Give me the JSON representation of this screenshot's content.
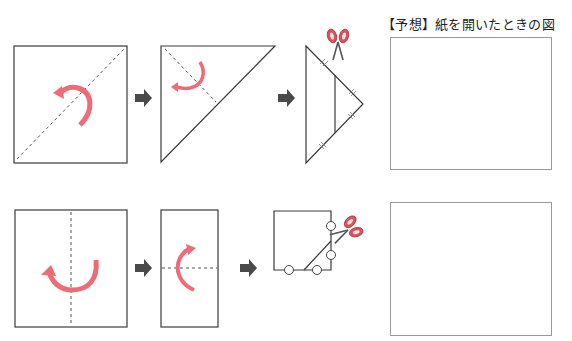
{
  "title": "【予想】紙を開いたときの図",
  "rows": [
    {
      "name": "diagonal-fold-row",
      "steps": [
        "square-with-diagonal-fold",
        "triangle-with-fold",
        "folded-triangle-cut"
      ],
      "cut_marks": "tick marks on edges",
      "answer_box": {
        "label": "prediction-box-1"
      }
    },
    {
      "name": "vertical-fold-row",
      "steps": [
        "square-with-vertical-fold",
        "rectangle-with-horizontal-fold",
        "folded-square-cut"
      ],
      "cut_marks": "circle markers",
      "answer_box": {
        "label": "prediction-box-2"
      }
    }
  ],
  "colors": {
    "line": "#3a3a3a",
    "fold_arrow": "#f06b78",
    "step_arrow": "#4a4a4a",
    "scissors_handle": "#d9535e",
    "box_border": "#9a9a9a"
  },
  "icons": [
    "fold-arrow-icon",
    "step-arrow-icon",
    "scissors-icon"
  ]
}
